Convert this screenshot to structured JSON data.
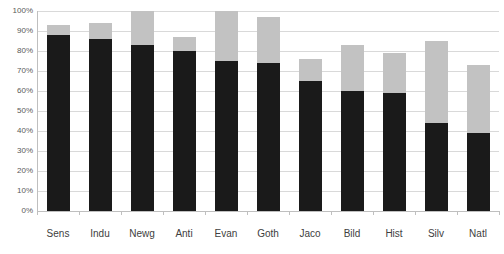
{
  "chart_data": {
    "type": "bar",
    "subtype": "stacked-bar",
    "title": "",
    "subtitle": "",
    "xlabel": "",
    "ylabel": "",
    "ylim": [
      0,
      100
    ],
    "y_tick_labels": [
      "100%",
      "90%",
      "80%",
      "70%",
      "60%",
      "50%",
      "40%",
      "30%",
      "20%",
      "10%",
      "0%"
    ],
    "y_tick_values": [
      100,
      90,
      80,
      70,
      60,
      50,
      40,
      30,
      20,
      10,
      0
    ],
    "grid": true,
    "legend": "none",
    "categories": [
      "Sens",
      "Indu",
      "Newg",
      "Anti",
      "Evan",
      "Goth",
      "Jaco",
      "Bild",
      "Hist",
      "Silv",
      "Natl"
    ],
    "series": [
      {
        "name": "dark",
        "color": "#1a1a1a",
        "values": [
          88,
          86,
          83,
          80,
          75,
          74,
          65,
          60,
          59,
          44,
          39
        ]
      },
      {
        "name": "light",
        "color": "#c2c2c2",
        "values": [
          5,
          8,
          17,
          7,
          25,
          23,
          11,
          23,
          20,
          41,
          34
        ]
      }
    ],
    "totals": [
      93,
      94,
      100,
      87,
      100,
      97,
      76,
      83,
      79,
      85,
      73
    ]
  },
  "colors": {
    "dark_segment": "#1a1a1a",
    "light_segment": "#c2c2c2",
    "gridline": "#d9d9d9",
    "axis": "#bfbfbf",
    "tick_text": "#595959",
    "category_text": "#404040",
    "background": "#ffffff"
  }
}
